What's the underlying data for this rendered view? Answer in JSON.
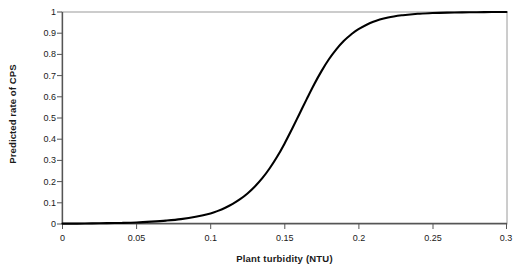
{
  "chart_data": {
    "type": "line",
    "title": "",
    "xlabel": "Plant turbidity (NTU)",
    "ylabel": "Predicted rate of CPS",
    "xlim": [
      0,
      0.3
    ],
    "ylim": [
      0,
      1
    ],
    "grid": false,
    "legend": null,
    "x_ticks": [
      "0",
      "0.05",
      "0.1",
      "0.15",
      "0.2",
      "0.25",
      "0.3"
    ],
    "x_tick_values": [
      0,
      0.05,
      0.1,
      0.15,
      0.2,
      0.25,
      0.3
    ],
    "y_ticks": [
      "0",
      "0.1",
      "0.2",
      "0.3",
      "0.4",
      "0.5",
      "0.6",
      "0.7",
      "0.8",
      "0.9",
      "1"
    ],
    "y_tick_values": [
      0,
      0.1,
      0.2,
      0.3,
      0.4,
      0.5,
      0.6,
      0.7,
      0.8,
      0.9,
      1
    ],
    "series": [
      {
        "name": "Predicted rate of CPS",
        "color": "#000000",
        "x": [
          0,
          0.01,
          0.02,
          0.03,
          0.04,
          0.05,
          0.06,
          0.07,
          0.08,
          0.09,
          0.1,
          0.105,
          0.11,
          0.115,
          0.12,
          0.125,
          0.13,
          0.135,
          0.14,
          0.145,
          0.15,
          0.155,
          0.16,
          0.165,
          0.17,
          0.175,
          0.18,
          0.185,
          0.19,
          0.195,
          0.2,
          0.21,
          0.22,
          0.23,
          0.24,
          0.25,
          0.26,
          0.27,
          0.28,
          0.29,
          0.3
        ],
        "y": [
          0.002,
          0.002,
          0.003,
          0.004,
          0.005,
          0.007,
          0.011,
          0.016,
          0.023,
          0.034,
          0.05,
          0.062,
          0.077,
          0.095,
          0.117,
          0.144,
          0.177,
          0.216,
          0.263,
          0.317,
          0.379,
          0.447,
          0.518,
          0.589,
          0.658,
          0.721,
          0.777,
          0.824,
          0.863,
          0.894,
          0.919,
          0.954,
          0.974,
          0.985,
          0.992,
          0.995,
          0.997,
          0.998,
          0.999,
          1.0,
          1.0
        ]
      }
    ]
  },
  "axes": {
    "y_title": "Predicted rate of CPS",
    "x_title": "Plant turbidity (NTU)"
  },
  "colors": {
    "curve": "#000000",
    "frame": "#808080",
    "axis": "#4d4d4d",
    "text": "#1a1a1a",
    "background": "#ffffff"
  }
}
